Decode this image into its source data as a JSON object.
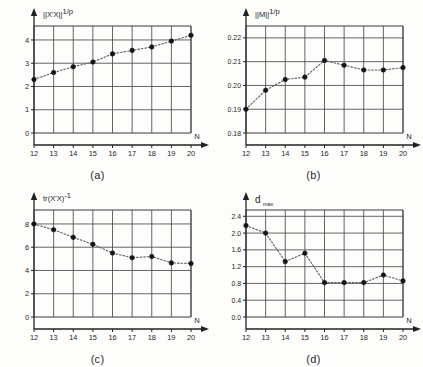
{
  "figure": {
    "panel_count": 4,
    "shared_xlabel": "N",
    "x_ticks": [
      12,
      13,
      14,
      15,
      16,
      17,
      18,
      19,
      20
    ],
    "xlim": [
      12,
      20
    ],
    "grid": true,
    "marker_style": "filled-circle",
    "line_style": "dotted",
    "line_color": "#5c5c5c",
    "marker_color": "#141414"
  },
  "chart_data": [
    {
      "type": "scatter",
      "panel": "a",
      "caption": "(a)",
      "title": "",
      "ylabel": "|X'X|",
      "ylabel_sup": "1/p",
      "xlabel": "N",
      "x": [
        12,
        13,
        14,
        15,
        16,
        17,
        18,
        19,
        20
      ],
      "values": [
        2.3,
        2.6,
        2.85,
        3.05,
        3.4,
        3.55,
        3.7,
        3.95,
        4.2
      ],
      "y_ticks": [
        0,
        1,
        2,
        3,
        4
      ],
      "ylim": [
        0,
        4.6
      ],
      "xlim": [
        12,
        20
      ],
      "grid": true,
      "legend": "none"
    },
    {
      "type": "scatter",
      "panel": "b",
      "caption": "(b)",
      "title": "",
      "ylabel": "|M|",
      "ylabel_sup": "1/p",
      "xlabel": "N",
      "x": [
        12,
        13,
        14,
        15,
        16,
        17,
        18,
        19,
        20
      ],
      "values": [
        0.19,
        0.198,
        0.2025,
        0.2035,
        0.2105,
        0.2085,
        0.2065,
        0.2065,
        0.2075
      ],
      "y_ticks": [
        0.18,
        0.19,
        0.2,
        0.21,
        0.22
      ],
      "y_tick_labels": [
        "0.18",
        "0.19",
        "0.20",
        "0.21",
        "0.22"
      ],
      "ylim": [
        0.18,
        0.225
      ],
      "xlim": [
        12,
        20
      ],
      "grid": true,
      "legend": "none"
    },
    {
      "type": "scatter",
      "panel": "c",
      "caption": "(c)",
      "title": "",
      "ylabel": "tr(X'X)",
      "ylabel_sup": "-1",
      "xlabel": "N",
      "x": [
        12,
        13,
        14,
        15,
        16,
        17,
        18,
        19,
        20
      ],
      "values": [
        8.0,
        7.5,
        6.85,
        6.25,
        5.5,
        5.1,
        5.2,
        4.65,
        4.6
      ],
      "y_ticks": [
        0,
        2,
        4,
        6,
        8
      ],
      "ylim": [
        0,
        9.2
      ],
      "xlim": [
        12,
        20
      ],
      "grid": true,
      "legend": "none"
    },
    {
      "type": "scatter",
      "panel": "d",
      "caption": "(d)",
      "title": "",
      "ylabel": "d",
      "ylabel_sub": "max",
      "xlabel": "N",
      "x": [
        12,
        13,
        14,
        15,
        16,
        17,
        18,
        19,
        20
      ],
      "values": [
        2.18,
        2.0,
        1.32,
        1.52,
        0.82,
        0.82,
        0.82,
        1.0,
        0.86
      ],
      "y_ticks": [
        0.0,
        0.4,
        0.8,
        1.2,
        1.6,
        2.0,
        2.4
      ],
      "y_tick_labels": [
        "0.0",
        "0.4",
        "0.8",
        "1.2",
        "1.6",
        "2.0",
        "2.4"
      ],
      "ylim": [
        0.0,
        2.55
      ],
      "xlim": [
        12,
        20
      ],
      "grid": true,
      "legend": "none"
    }
  ]
}
